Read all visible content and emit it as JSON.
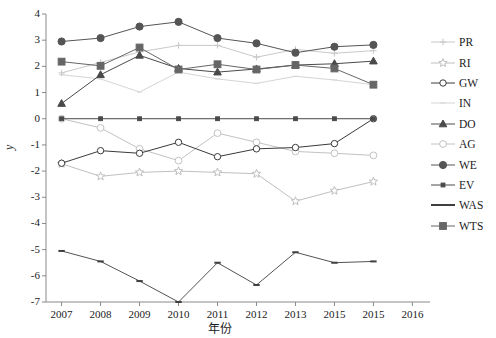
{
  "chart_data": {
    "type": "line",
    "title": "",
    "xlabel": "年份",
    "ylabel": "y",
    "x": [
      2007,
      2008,
      2009,
      2010,
      2011,
      2012,
      2013,
      2014,
      2015
    ],
    "xtick_labels": [
      "2007",
      "2008",
      "2009",
      "2010",
      "2011",
      "2012",
      "2013",
      "2015",
      "2015",
      "2016"
    ],
    "xlim": [
      2006.6,
      2016.4
    ],
    "ylim": [
      -7,
      4
    ],
    "ytick_labels": [
      "4",
      "3",
      "2",
      "1",
      "0",
      "-1",
      "-2",
      "-3",
      "-4",
      "-5",
      "-6",
      "-7"
    ],
    "yticks": [
      4,
      3,
      2,
      1,
      0,
      -1,
      -2,
      -3,
      -4,
      -5,
      -6,
      -7
    ],
    "grid": false,
    "legend_position": "right",
    "series": [
      {
        "name": "PR",
        "marker": "plus-line",
        "color": "#c9c9c9",
        "filled": false,
        "values": [
          1.75,
          2.15,
          2.55,
          2.8,
          2.8,
          2.35,
          2.65,
          2.5,
          2.6
        ]
      },
      {
        "name": "RI",
        "marker": "open-star",
        "color": "#bfbfbf",
        "filled": false,
        "values": [
          -1.72,
          -2.2,
          -2.05,
          -2.0,
          -2.05,
          -2.1,
          -3.15,
          -2.75,
          -2.4
        ]
      },
      {
        "name": "GW",
        "marker": "open-circle",
        "color": "#3a3a3a",
        "filled": false,
        "values": [
          -1.7,
          -1.22,
          -1.32,
          -0.9,
          -1.45,
          -1.15,
          -1.1,
          -0.95,
          0.0
        ]
      },
      {
        "name": "IN",
        "marker": "plain-line",
        "color": "#d5d5d5",
        "filled": false,
        "values": [
          1.68,
          1.52,
          1.02,
          1.78,
          1.52,
          1.35,
          1.62,
          1.48,
          1.3
        ]
      },
      {
        "name": "DO",
        "marker": "filled-tri",
        "color": "#4a4a4a",
        "filled": true,
        "values": [
          0.58,
          1.68,
          2.42,
          1.92,
          1.78,
          1.9,
          2.05,
          2.1,
          2.2
        ]
      },
      {
        "name": "AG",
        "marker": "open-circle2",
        "color": "#c2c2c2",
        "filled": false,
        "values": [
          0.0,
          -0.35,
          -1.15,
          -1.6,
          -0.55,
          -0.9,
          -1.25,
          -1.32,
          -1.4
        ]
      },
      {
        "name": "WE",
        "marker": "filled-circle",
        "color": "#555555",
        "filled": true,
        "values": [
          2.95,
          3.08,
          3.52,
          3.7,
          3.08,
          2.88,
          2.52,
          2.75,
          2.82
        ]
      },
      {
        "name": "EV",
        "marker": "small-square",
        "color": "#4a4a4a",
        "filled": true,
        "values": [
          0.0,
          0.0,
          0.0,
          0.0,
          0.0,
          0.0,
          0.0,
          0.0,
          0.0
        ]
      },
      {
        "name": "WAS",
        "marker": "dash",
        "color": "#3f3f3f",
        "filled": true,
        "values": [
          -5.05,
          -5.45,
          -6.2,
          -7.0,
          -5.5,
          -6.35,
          -5.1,
          -5.5,
          -5.45
        ]
      },
      {
        "name": "WTS",
        "marker": "filled-square",
        "color": "#666666",
        "filled": true,
        "values": [
          2.18,
          2.02,
          2.72,
          1.88,
          2.08,
          1.88,
          2.05,
          1.92,
          1.3
        ]
      }
    ]
  },
  "legend": {
    "entries": [
      "PR",
      "RI",
      "GW",
      "IN",
      "DO",
      "AG",
      "WE",
      "EV",
      "WAS",
      "WTS"
    ]
  },
  "axes": {
    "y_axis_label": "y",
    "x_axis_label": "年份"
  }
}
